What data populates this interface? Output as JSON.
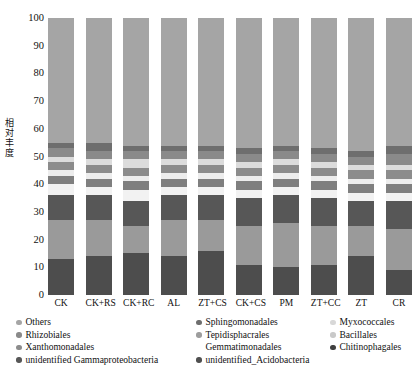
{
  "chart": {
    "type": "bar",
    "title": "",
    "ylabel": "相对丰度",
    "ylabel_chars": [
      "相",
      "对",
      "丰",
      "度"
    ],
    "xlabel": "",
    "ylim": [
      0,
      100
    ],
    "yticks": [
      0,
      10,
      20,
      30,
      40,
      50,
      60,
      70,
      80,
      90,
      100
    ],
    "grid": false,
    "legend_position": "bottom"
  },
  "chart_data": {
    "type": "bar",
    "stacked": true,
    "stack_total": 100,
    "title": "",
    "xlabel": "",
    "ylabel": "相对丰度",
    "ylim": [
      0,
      100
    ],
    "yticks": [
      0,
      10,
      20,
      30,
      40,
      50,
      60,
      70,
      80,
      90,
      100
    ],
    "grid": false,
    "legend_position": "bottom",
    "categories": [
      "CK",
      "CK+RS",
      "CK+RC",
      "AL",
      "ZT+CS",
      "CK+CS",
      "PM",
      "ZT+CC",
      "ZT",
      "CR"
    ],
    "series": [
      {
        "name": "Chitinophagales",
        "color": "#4d4d4d",
        "values": [
          13,
          14,
          15,
          14,
          16,
          11,
          10,
          11,
          14,
          9
        ]
      },
      {
        "name": "unidentified_Acidobacteria",
        "color": "#9a9a9a",
        "values": [
          14,
          13,
          10,
          13,
          11,
          14,
          16,
          14,
          11,
          15
        ]
      },
      {
        "name": "unidentified Gammaproteobacteria",
        "color": "#575757",
        "values": [
          9,
          9,
          9,
          9,
          9,
          10,
          10,
          10,
          9,
          10
        ]
      },
      {
        "name": "Bacillales",
        "color": "#f2f2f2",
        "values": [
          4,
          3,
          4,
          3,
          3,
          3,
          3,
          3,
          3,
          3
        ]
      },
      {
        "name": "Gemmatimonadales",
        "color": "#7f7f7f",
        "values": [
          3,
          3,
          3,
          3,
          3,
          3,
          3,
          3,
          3,
          3
        ]
      },
      {
        "name": "Myxococcales",
        "color": "#ededed",
        "values": [
          2,
          2,
          2,
          2,
          2,
          2,
          2,
          2,
          2,
          2
        ]
      },
      {
        "name": "Xanthomonadales",
        "color": "#8c8c8c",
        "values": [
          3,
          3,
          3,
          3,
          3,
          3,
          3,
          3,
          3,
          3
        ]
      },
      {
        "name": "Tepidisphacrales",
        "color": "#dcdcdc",
        "values": [
          2,
          2,
          3,
          2,
          2,
          2,
          2,
          2,
          2,
          2
        ]
      },
      {
        "name": "Rhizobiales",
        "color": "#8a8a8a",
        "values": [
          3,
          3,
          3,
          3,
          3,
          3,
          3,
          3,
          3,
          4
        ]
      },
      {
        "name": "Sphingomonadales",
        "color": "#6e6e6e",
        "values": [
          2,
          3,
          2,
          2,
          2,
          2,
          2,
          2,
          2,
          3
        ]
      },
      {
        "name": "Others",
        "color": "#a5a5a5",
        "values": [
          45,
          45,
          46,
          46,
          46,
          47,
          46,
          47,
          48,
          46
        ]
      }
    ]
  },
  "legend": {
    "columns": [
      {
        "items": [
          {
            "label": "Others",
            "color": "#a5a5a5"
          },
          {
            "label": "Rhizobiales",
            "color": "#8a8a8a"
          },
          {
            "label": "Xanthomonadales",
            "color": "#8c8c8c"
          },
          {
            "label": "unidentified Gammaproteobacteria",
            "color": "#575757"
          }
        ]
      },
      {
        "items": [
          {
            "label": "Sphingomonadales",
            "color": "#6e6e6e"
          },
          {
            "label": "Tepidisphacrales",
            "color": "#9d9d9d"
          },
          {
            "label": "Gemmatimonadales",
            "color": "transparent"
          },
          {
            "label": "unidentified_Acidobacteria",
            "color": "#4f4f4f"
          }
        ]
      },
      {
        "items": [
          {
            "label": "Myxococcales",
            "color": "#d8d8d8"
          },
          {
            "label": "Bacillales",
            "color": "#c9c9c9"
          },
          {
            "label": "Chitinophagales",
            "color": "#3f3f3f"
          }
        ]
      }
    ]
  }
}
